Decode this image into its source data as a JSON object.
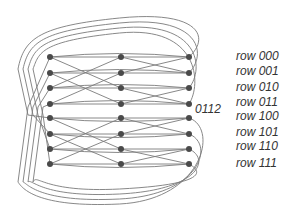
{
  "diagram": {
    "type": "butterfly-network",
    "stages": 3,
    "columns_x": [
      50,
      121,
      189
    ],
    "rows_y": [
      57,
      73,
      88,
      104,
      118,
      134,
      149,
      164
    ],
    "node_color": "#4a4a4a",
    "edge_color": "#7a7a7a",
    "row_labels": [
      "row 000",
      "row 001",
      "row 010",
      "row 011",
      "row 100",
      "row 101",
      "row 110",
      "row 111"
    ],
    "row_label_y": [
      56,
      71,
      87,
      102,
      116,
      132,
      146,
      163
    ],
    "row_label_x": 236,
    "annotation": {
      "text": "0112",
      "x": 195,
      "y": 109
    },
    "straight_edges": [
      [
        0,
        0,
        1,
        0
      ],
      [
        0,
        1,
        1,
        1
      ],
      [
        0,
        2,
        1,
        2
      ],
      [
        0,
        3,
        1,
        3
      ],
      [
        0,
        4,
        1,
        4
      ],
      [
        0,
        5,
        1,
        5
      ],
      [
        0,
        6,
        1,
        6
      ],
      [
        0,
        7,
        1,
        7
      ],
      [
        1,
        0,
        2,
        0
      ],
      [
        1,
        1,
        2,
        1
      ],
      [
        1,
        2,
        2,
        2
      ],
      [
        1,
        3,
        2,
        3
      ],
      [
        1,
        4,
        2,
        4
      ],
      [
        1,
        5,
        2,
        5
      ],
      [
        1,
        6,
        2,
        6
      ],
      [
        1,
        7,
        2,
        7
      ]
    ],
    "cross_edges": [
      [
        0,
        0,
        1,
        2
      ],
      [
        0,
        2,
        1,
        0
      ],
      [
        0,
        1,
        1,
        3
      ],
      [
        0,
        3,
        1,
        1
      ],
      [
        0,
        4,
        1,
        6
      ],
      [
        0,
        6,
        1,
        4
      ],
      [
        0,
        5,
        1,
        7
      ],
      [
        0,
        7,
        1,
        5
      ],
      [
        1,
        0,
        2,
        1
      ],
      [
        1,
        1,
        2,
        0
      ],
      [
        1,
        2,
        2,
        3
      ],
      [
        1,
        3,
        2,
        2
      ],
      [
        1,
        4,
        2,
        5
      ],
      [
        1,
        5,
        2,
        4
      ],
      [
        1,
        6,
        2,
        7
      ],
      [
        1,
        7,
        2,
        6
      ]
    ],
    "long_edges": [
      [
        0,
        0,
        2,
        0
      ],
      [
        0,
        1,
        2,
        1
      ],
      [
        0,
        2,
        2,
        2
      ],
      [
        0,
        3,
        2,
        3
      ],
      [
        0,
        4,
        2,
        4
      ],
      [
        0,
        5,
        2,
        5
      ],
      [
        0,
        6,
        2,
        6
      ],
      [
        0,
        7,
        2,
        7
      ]
    ]
  }
}
